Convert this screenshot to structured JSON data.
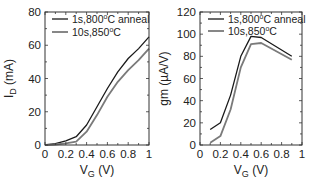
{
  "chart_data": [
    {
      "type": "line",
      "title": "",
      "xlabel": "V",
      "xlabel_sub": "G",
      "xlabel_unit": " (V)",
      "ylabel": "I",
      "ylabel_sub": "D",
      "ylabel_unit": " (mA)",
      "xlim": [
        0,
        1
      ],
      "ylim": [
        0,
        80
      ],
      "xticks": [
        0,
        0.2,
        0.4,
        0.6,
        0.8,
        1
      ],
      "xtick_labels": [
        "0",
        "0.2",
        "0.4",
        "0.6",
        "0.8",
        "1"
      ],
      "yticks": [
        0,
        20,
        40,
        60,
        80
      ],
      "ytick_labels": [
        "0",
        "20",
        "40",
        "60",
        "80"
      ],
      "grid": false,
      "legend_position": "top-left",
      "series": [
        {
          "name": "1s,800°C anneal",
          "legend_main": "1s,800",
          "legend_sup": "o",
          "legend_tail": "C anneal",
          "color": "#1a1a1a",
          "x": [
            0,
            0.1,
            0.2,
            0.3,
            0.4,
            0.5,
            0.6,
            0.7,
            0.8,
            0.9,
            1.0
          ],
          "y": [
            0,
            0.8,
            2.5,
            5,
            12,
            23,
            34,
            44,
            52,
            58,
            65
          ]
        },
        {
          "name": "10s,850°C",
          "legend_main": "10s,850",
          "legend_sup": "o",
          "legend_tail": "C",
          "color": "#7a7a7a",
          "x": [
            0,
            0.1,
            0.2,
            0.3,
            0.4,
            0.5,
            0.6,
            0.7,
            0.8,
            0.9,
            1.0
          ],
          "y": [
            0,
            0.3,
            1,
            2,
            8,
            18,
            29,
            38,
            45,
            51,
            58
          ]
        }
      ]
    },
    {
      "type": "line",
      "title": "",
      "xlabel": "V",
      "xlabel_sub": "G",
      "xlabel_unit": " (V)",
      "ylabel": "gm (µA/V)",
      "xlim": [
        0,
        1
      ],
      "ylim": [
        0,
        120
      ],
      "xticks": [
        0,
        0.2,
        0.4,
        0.6,
        0.8,
        1
      ],
      "xtick_labels": [
        "0",
        "0.2",
        "0.4",
        "0.6",
        "0.8",
        "1"
      ],
      "yticks": [
        0,
        20,
        40,
        60,
        80,
        100,
        120
      ],
      "ytick_labels": [
        "0",
        "20",
        "40",
        "60",
        "80",
        "100",
        "120"
      ],
      "grid": false,
      "legend_position": "top",
      "series": [
        {
          "name": "1s,800°C anneal",
          "legend_main": "1s,800",
          "legend_sup": "o",
          "legend_tail": "C anneal",
          "color": "#1a1a1a",
          "x": [
            0.1,
            0.2,
            0.3,
            0.4,
            0.5,
            0.6,
            0.9
          ],
          "y": [
            14,
            20,
            45,
            80,
            98,
            97,
            80
          ]
        },
        {
          "name": "10s,850°C",
          "legend_main": "10s,850",
          "legend_sup": "o",
          "legend_tail": "C",
          "color": "#7a7a7a",
          "x": [
            0.1,
            0.2,
            0.3,
            0.4,
            0.5,
            0.6,
            0.9
          ],
          "y": [
            2,
            8,
            32,
            70,
            91,
            92,
            77
          ]
        }
      ]
    }
  ]
}
